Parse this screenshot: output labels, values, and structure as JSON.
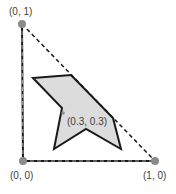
{
  "diagram": {
    "vertices": {
      "origin": {
        "label": "(0, 0)",
        "x": 23,
        "y": 161
      },
      "top": {
        "label": "(0, 1)",
        "x": 22,
        "y": 24
      },
      "right": {
        "label": "(1, 0)",
        "x": 155,
        "y": 161
      }
    },
    "centroid": {
      "label": "(0.3, 0.3)",
      "x": 63,
      "y": 113
    },
    "polygon_points": "33,78 71,75 113,118 121,149 86,129 54,149 62,108",
    "colors": {
      "vertex_dot": "#8a8a8a",
      "polygon_fill": "#dcdcdc",
      "stroke": "#1a1a1a"
    }
  }
}
